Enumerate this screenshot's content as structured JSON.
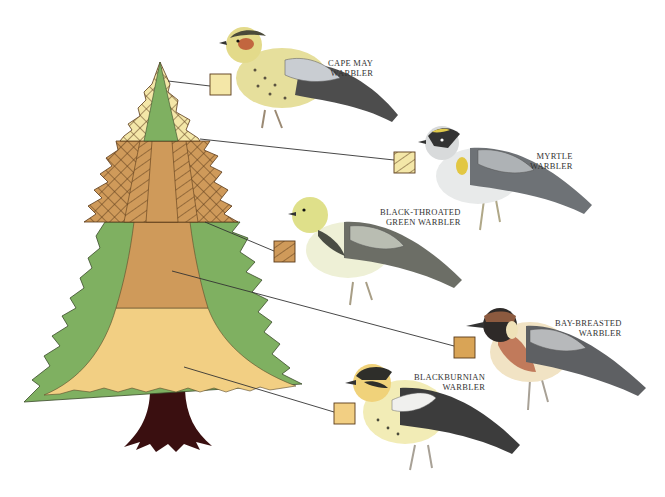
{
  "figure": {
    "colors": {
      "background": "#ffffff",
      "green": "#7fb061",
      "pale_yellow": "#f4e7a8",
      "tan_mid": "#cf9a5a",
      "tan_light": "#f2cf83",
      "trunk": "#3a0f10",
      "hatch": "#5a3a1a",
      "leader_line": "#333333"
    }
  },
  "zones": [
    {
      "id": "cape-may",
      "swatch": "plain-pale-yellow",
      "color": "#f4e7a8",
      "description": "Tree top outer branches"
    },
    {
      "id": "myrtle",
      "swatch": "hatched-pale-yellow",
      "color": "#f4e7a8",
      "description": "Upper middle outer branches"
    },
    {
      "id": "black-throated-green",
      "swatch": "hatched-tan",
      "color": "#cf9a5a",
      "description": "Upper middle inner branches"
    },
    {
      "id": "bay-breasted",
      "swatch": "plain-tan",
      "color": "#cf9a5a",
      "description": "Middle interior"
    },
    {
      "id": "blackburnian",
      "swatch": "plain-light-tan",
      "color": "#f2cf83",
      "description": "Lower interior"
    }
  ],
  "birds": [
    {
      "id": "cape-may",
      "line1": "CAPE MAY",
      "line2": "WARBLER"
    },
    {
      "id": "myrtle",
      "line1": "MYRTLE",
      "line2": "WARBLER"
    },
    {
      "id": "black-throated-green",
      "line1": "BLACK-THROATED",
      "line2": "GREEN WARBLER"
    },
    {
      "id": "bay-breasted",
      "line1": "BAY-BREASTED",
      "line2": "WARBLER"
    },
    {
      "id": "blackburnian",
      "line1": "BLACKBURNIAN",
      "line2": "WARBLER"
    }
  ]
}
